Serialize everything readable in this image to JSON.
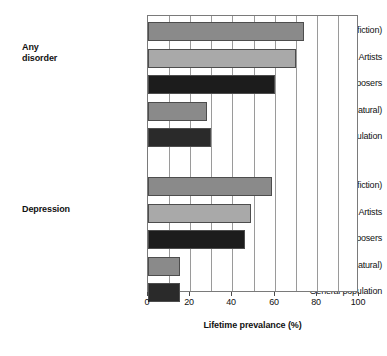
{
  "chart_data": {
    "type": "bar",
    "orientation": "horizontal",
    "title": "",
    "xlabel": "Lifetime prevalance (%)",
    "ylabel": "",
    "xlim": [
      0,
      100
    ],
    "xticks": [
      0,
      20,
      40,
      60,
      80,
      100
    ],
    "xtick_labels": [
      "0",
      "20",
      "40",
      "60",
      "80",
      "100"
    ],
    "minor_gridline_step": 10,
    "grid": true,
    "legend": "none",
    "groups": [
      {
        "name": "Any disorder",
        "label_lines": [
          "Any",
          "disorder"
        ],
        "categories": [
          "Writers (fiction)",
          "Artists",
          "Composers",
          "Scientists (natural)",
          "General population"
        ],
        "values": [
          74,
          70,
          60,
          28,
          30
        ],
        "colors": [
          "#8a8a8a",
          "#a9a9a9",
          "#1c1c1c",
          "#8a8a8a",
          "#2a2a2a"
        ]
      },
      {
        "name": "Depression",
        "label_lines": [
          "Depression"
        ],
        "categories": [
          "Writers (fiction)",
          "Artists",
          "Composers",
          "Scientists (natural)",
          "General population"
        ],
        "values": [
          59,
          49,
          46,
          15,
          15
        ],
        "colors": [
          "#8a8a8a",
          "#a9a9a9",
          "#1c1c1c",
          "#8a8a8a",
          "#2a2a2a"
        ]
      }
    ]
  },
  "style": {
    "background": "#ffffff",
    "page_background": "#e8e8e6",
    "axis_color": "#7a7a7a",
    "gridline_color": "#9a9a9a",
    "text_color": "#111111",
    "bar_shadow_color": "#231f20"
  }
}
